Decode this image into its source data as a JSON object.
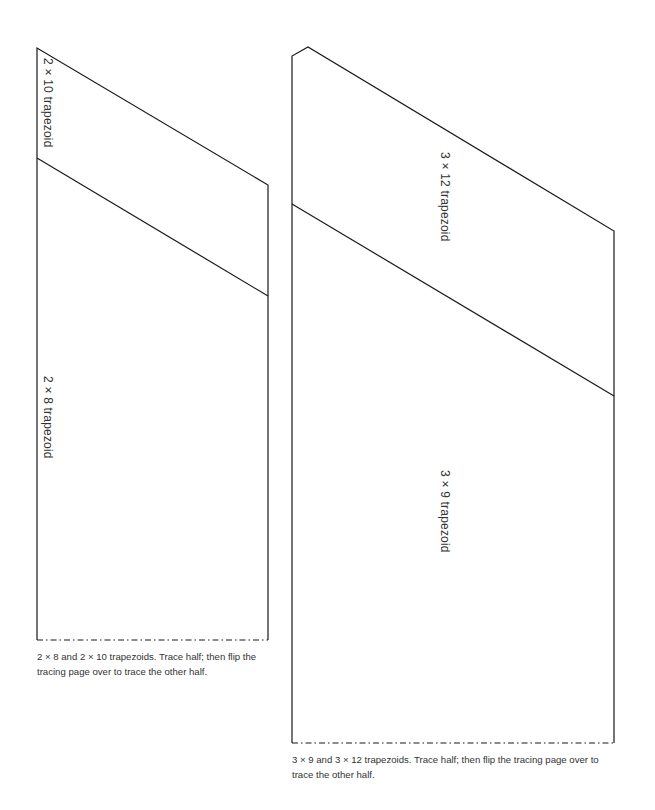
{
  "left_pattern": {
    "upper_label": "2 × 10 trapezoid",
    "lower_label": "2 × 8 trapezoid",
    "caption": "2 × 8 and 2 × 10 trapezoids. Trace half; then flip the tracing page over to trace the other half."
  },
  "right_pattern": {
    "upper_label": "3 × 12 trapezoid",
    "lower_label": "3 × 9 trapezoid",
    "caption": "3 × 9 and 3 × 12 trapezoids. Trace half; then flip the tracing page over to trace the other half."
  },
  "colors": {
    "line": "#1a1a1a",
    "text": "#333333"
  }
}
